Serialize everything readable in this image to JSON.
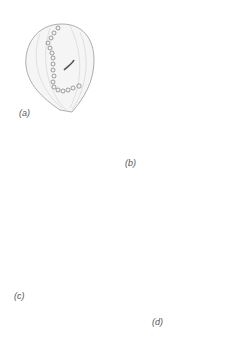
{
  "figure": {
    "panels": [
      {
        "id": "a",
        "label": "(a)"
      },
      {
        "id": "b",
        "label": "(b)"
      },
      {
        "id": "c",
        "label": "(c)"
      },
      {
        "id": "d",
        "label": "(d)"
      }
    ],
    "colors": {
      "outline": "#999999",
      "stripe": "#dddddd",
      "body": "#f4f4f4",
      "cilia": "#333333",
      "arrow": "#888888"
    }
  }
}
